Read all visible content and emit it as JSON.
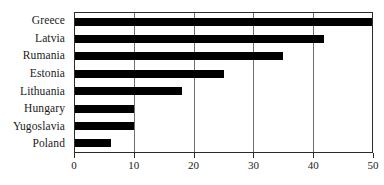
{
  "chart_data": {
    "type": "bar",
    "orientation": "horizontal",
    "title": "",
    "subtitle": "",
    "xlabel": "",
    "ylabel": "",
    "categories": [
      "Greece",
      "Latvia",
      "Rumania",
      "Estonia",
      "Lithuania",
      "Hungary",
      "Yugoslavia",
      "Poland"
    ],
    "values": [
      50,
      42,
      35,
      25,
      18,
      10,
      10,
      6
    ],
    "xlim": [
      0,
      50
    ],
    "xticks": [
      0,
      10,
      20,
      30,
      40,
      50
    ],
    "xtick_labels": [
      "0",
      "10",
      "20",
      "30",
      "40",
      "50"
    ],
    "grid": true,
    "grid_axis": "x",
    "legend": null,
    "legend_position": "none",
    "annotations": [],
    "bar_color": "#000000",
    "frame_color": "#2b2b2b",
    "grid_color": "#6e6e6e",
    "background": "#ffffff"
  }
}
